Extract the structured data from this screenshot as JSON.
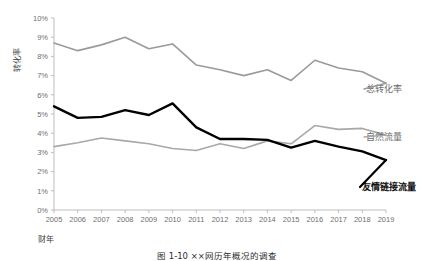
{
  "chart_data": {
    "type": "line",
    "title": "",
    "xlabel": "财年",
    "ylabel": "转化率",
    "x": [
      2005,
      2006,
      2007,
      2008,
      2009,
      2010,
      2011,
      2012,
      2013,
      2014,
      2015,
      2016,
      2017,
      2018,
      2019
    ],
    "categories": [
      "2005",
      "2006",
      "2007",
      "2008",
      "2009",
      "2010",
      "2011",
      "2012",
      "2013",
      "2014",
      "2015",
      "2016",
      "2017",
      "2018",
      "2019"
    ],
    "ylim": [
      0,
      10
    ],
    "ytick_labels": [
      "0%",
      "1%",
      "2%",
      "3%",
      "4%",
      "5%",
      "6%",
      "7%",
      "8%",
      "9%",
      "10%"
    ],
    "ytick_values": [
      0,
      1,
      2,
      3,
      4,
      5,
      6,
      7,
      8,
      9,
      10
    ],
    "grid": false,
    "legend_position": "right-inline-labels",
    "series": [
      {
        "name": "总转化率",
        "color": "#9a9a9a",
        "width": 1.6,
        "values": [
          8.7,
          8.3,
          8.6,
          9.0,
          8.4,
          8.65,
          7.55,
          7.3,
          7.0,
          7.3,
          6.75,
          7.8,
          7.4,
          7.2,
          6.6
        ]
      },
      {
        "name": "自然流量",
        "color": "#a8a8a8",
        "width": 1.6,
        "values": [
          3.3,
          3.5,
          3.75,
          3.6,
          3.45,
          3.2,
          3.1,
          3.45,
          3.2,
          3.6,
          3.45,
          4.4,
          4.2,
          4.25,
          3.9
        ]
      },
      {
        "name": "友情链接流量",
        "color": "#000000",
        "width": 2.4,
        "values": [
          5.4,
          4.8,
          4.85,
          5.2,
          4.95,
          5.55,
          4.3,
          3.7,
          3.7,
          3.65,
          3.25,
          3.6,
          3.3,
          3.05,
          2.6
        ]
      }
    ],
    "series_label_text": {
      "total": "总转化率",
      "organic": "自然流量",
      "referral": "友情链接流量"
    }
  },
  "axes": {
    "y_title": "转化率",
    "x_title": "财年"
  },
  "caption": {
    "text": "图 1-10  ××网历年概况的调查"
  }
}
